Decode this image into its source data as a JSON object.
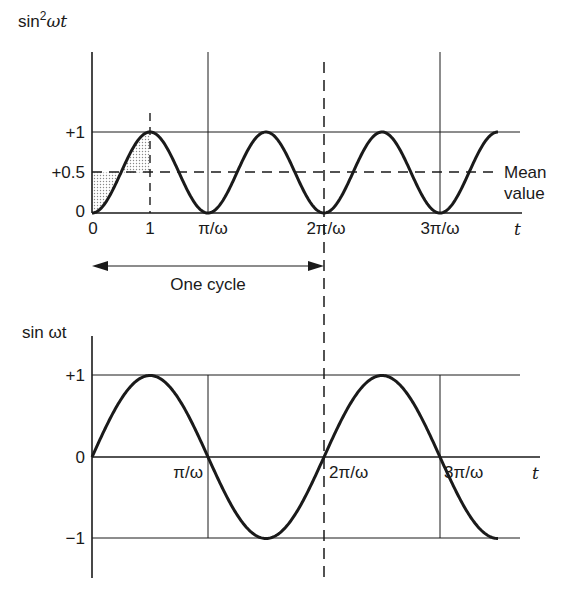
{
  "figure": {
    "top_plot": {
      "ylabel_base": "sin",
      "ylabel_sup": "2",
      "ylabel_tail": "ωt",
      "y_ticks": [
        "+1",
        "+0.5",
        "0"
      ],
      "x_ticks": [
        "0",
        "1",
        "π/ω",
        "2π/ω",
        "3π/ω"
      ],
      "x_axis_label": "t",
      "mean_annotation_line1": "Mean",
      "mean_annotation_line2": "value"
    },
    "cycle_annotation": {
      "label": "One cycle"
    },
    "bottom_plot": {
      "ylabel": "sin ωt",
      "y_ticks": [
        "+1",
        "0",
        "−1"
      ],
      "x_ticks": [
        "π/ω",
        "2π/ω",
        "3π/ω"
      ],
      "x_axis_label": "t"
    },
    "colors": {
      "ink": "#1a1a1a",
      "shade": "#c8c8c8",
      "background": "#ffffff"
    }
  },
  "chart_data": [
    {
      "type": "line",
      "title": "sin²ωt versus t",
      "ylabel": "sin²ωt",
      "xlabel": "t",
      "x_ticks": [
        "0",
        "1",
        "π/ω",
        "2π/ω",
        "3π/ω"
      ],
      "y_ticks": [
        0,
        0.5,
        1
      ],
      "ylim": [
        0,
        1
      ],
      "xrange_in_pi_over_omega": [
        0,
        3.5
      ],
      "series": [
        {
          "name": "sin²ωt",
          "function": "sin^2(ωt)",
          "min": 0,
          "max": 1,
          "period": "π/ω"
        }
      ],
      "reference_lines": [
        {
          "type": "horizontal",
          "y": 1,
          "style": "solid"
        },
        {
          "type": "horizontal",
          "y": 0.5,
          "style": "dashed",
          "label": "Mean value"
        },
        {
          "type": "vertical",
          "x": "π/(2ω)",
          "label": "1",
          "style": "dashed"
        },
        {
          "type": "vertical",
          "x": "π/ω",
          "style": "solid"
        },
        {
          "type": "vertical",
          "x": "2π/ω",
          "style": "dashed"
        },
        {
          "type": "vertical",
          "x": "3π/ω",
          "style": "solid"
        }
      ],
      "shaded_region": "area between curve and mean line over first quarter cycle",
      "annotations": [
        "One cycle: from 0 to 2π/ω"
      ]
    },
    {
      "type": "line",
      "title": "sin ωt versus t",
      "ylabel": "sin ωt",
      "xlabel": "t",
      "x_ticks": [
        "π/ω",
        "2π/ω",
        "3π/ω"
      ],
      "y_ticks": [
        -1,
        0,
        1
      ],
      "ylim": [
        -1,
        1
      ],
      "xrange_in_pi_over_omega": [
        0,
        3.5
      ],
      "series": [
        {
          "name": "sin ωt",
          "function": "sin(ωt)",
          "min": -1,
          "max": 1,
          "period": "2π/ω"
        }
      ],
      "reference_lines": [
        {
          "type": "horizontal",
          "y": 1,
          "style": "solid"
        },
        {
          "type": "horizontal",
          "y": -1,
          "style": "solid"
        },
        {
          "type": "vertical",
          "x": "π/ω",
          "style": "solid"
        },
        {
          "type": "vertical",
          "x": "2π/ω",
          "style": "dashed"
        },
        {
          "type": "vertical",
          "x": "3π/ω",
          "style": "solid"
        }
      ]
    }
  ]
}
